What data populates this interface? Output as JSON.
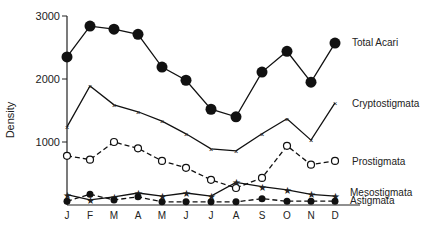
{
  "chart_data": {
    "type": "line",
    "title": "",
    "xlabel": "",
    "ylabel": "Density",
    "ylim": [
      0,
      3000
    ],
    "yticks": [
      1000,
      2000,
      3000
    ],
    "grid": false,
    "legend_position": "inline-right",
    "categories": [
      "J",
      "F",
      "M",
      "A",
      "M",
      "J",
      "J",
      "A",
      "S",
      "O",
      "N",
      "D"
    ],
    "series": [
      {
        "name": "Total Acari",
        "marker": "filled-circle",
        "line": "solid",
        "values": [
          2350,
          2840,
          2790,
          2710,
          2190,
          1980,
          1520,
          1400,
          2110,
          2440,
          1950,
          2570
        ]
      },
      {
        "name": "Cryptostigmata",
        "marker": "x",
        "line": "solid",
        "values": [
          1240,
          1890,
          1590,
          1480,
          1330,
          1130,
          890,
          860,
          1130,
          1370,
          1030,
          1620
        ]
      },
      {
        "name": "Prostigmata",
        "marker": "open-circle",
        "line": "dashed",
        "values": [
          780,
          720,
          1000,
          900,
          700,
          590,
          400,
          270,
          430,
          940,
          640,
          700
        ]
      },
      {
        "name": "Mesostigmata",
        "marker": "star",
        "line": "solid",
        "values": [
          165,
          80,
          130,
          190,
          140,
          190,
          140,
          360,
          290,
          240,
          170,
          140
        ]
      },
      {
        "name": "Astigmata",
        "marker": "filled-circle-small",
        "line": "dashed",
        "values": [
          60,
          170,
          80,
          130,
          50,
          50,
          50,
          50,
          100,
          60,
          60,
          60
        ]
      }
    ]
  }
}
